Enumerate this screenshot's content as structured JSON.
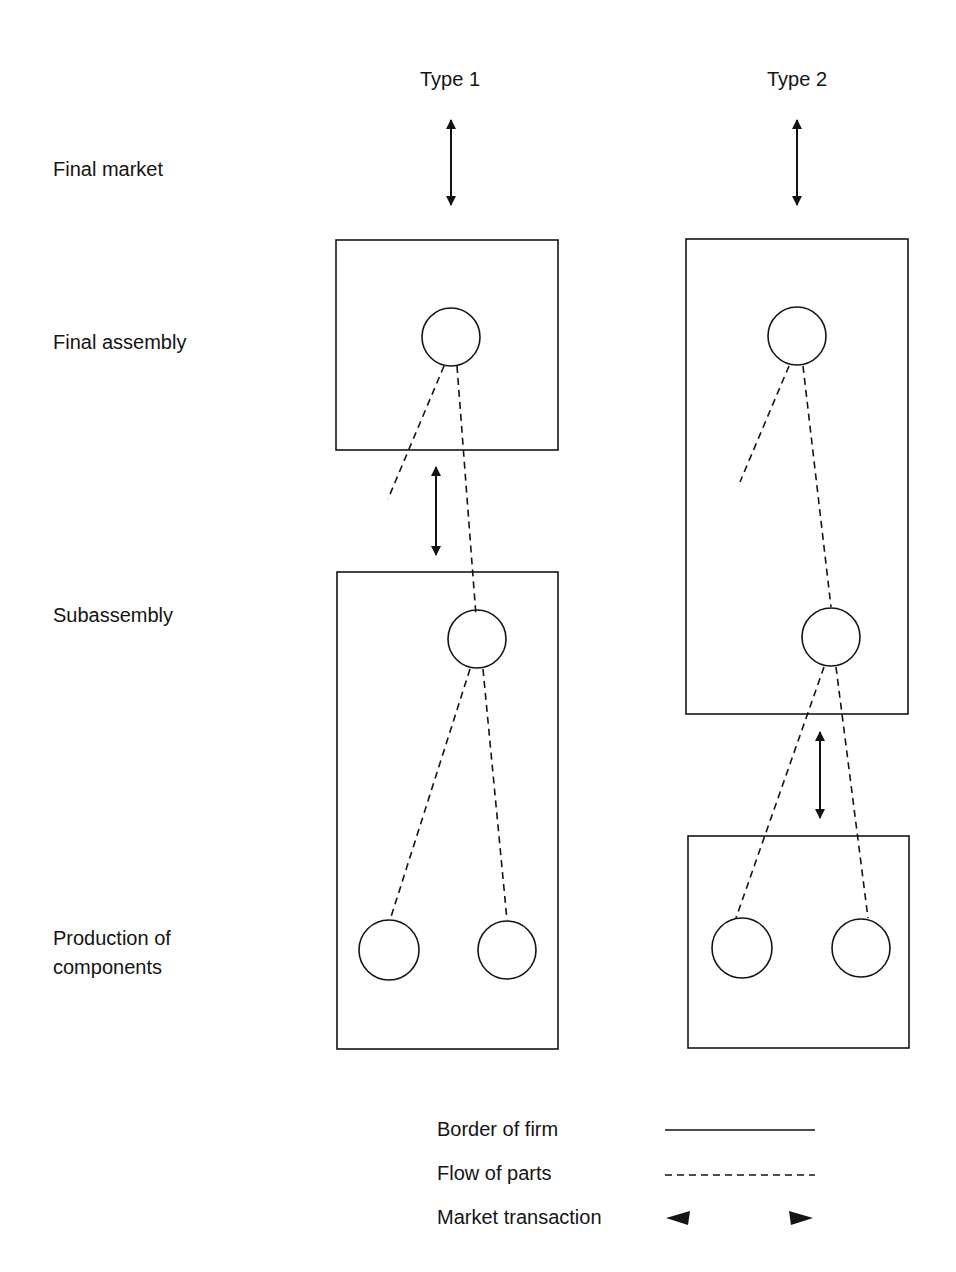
{
  "columns": [
    {
      "id": "type1",
      "title": "Type 1"
    },
    {
      "id": "type2",
      "title": "Type 2"
    }
  ],
  "rows": [
    {
      "id": "final-market",
      "label": "Final market"
    },
    {
      "id": "final-assembly",
      "label": "Final assembly"
    },
    {
      "id": "subassembly",
      "label": "Subassembly"
    },
    {
      "id": "production",
      "label_line1": "Production of",
      "label_line2": "components"
    }
  ],
  "legend": {
    "border": "Border of firm",
    "flow": "Flow of parts",
    "market": "Market transaction"
  },
  "colors": {
    "ink": "#141414",
    "background": "#ffffff"
  }
}
